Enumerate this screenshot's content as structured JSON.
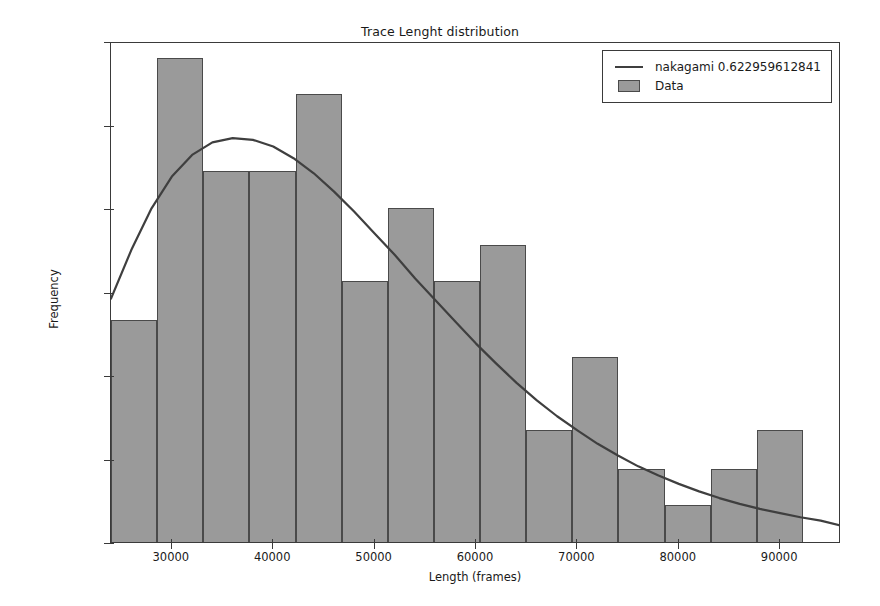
{
  "chart_data": {
    "type": "bar",
    "title": "Trace Lenght distribution",
    "xlabel": "Length (frames)",
    "ylabel": "Frequency",
    "xlim": [
      24000,
      96000
    ],
    "ylim": [
      0.0,
      3e-05
    ],
    "xticks": [
      30000,
      40000,
      50000,
      60000,
      70000,
      80000,
      90000
    ],
    "xtick_labels": [
      "30000",
      "40000",
      "50000",
      "60000",
      "70000",
      "80000",
      "90000"
    ],
    "yticks": [
      0.0,
      5e-06,
      1e-05,
      1.5e-05,
      2e-05,
      2.5e-05,
      3e-05
    ],
    "ytick_labels": [
      "0.000000",
      "0.000005",
      "0.000010",
      "0.000015",
      "0.000020",
      "0.000025",
      "0.000030"
    ],
    "grid": false,
    "legend_position": "upper right",
    "series": [
      {
        "name": "Data",
        "type": "histogram",
        "color": "#9a9a9a",
        "edge_color": "#4a4a4a",
        "bin_edges": [
          24000,
          28550,
          33100,
          37650,
          42200,
          46750,
          51300,
          55850,
          60400,
          64950,
          69500,
          74050,
          78600,
          83150,
          87700,
          92250
        ],
        "values": [
          1.33e-05,
          2.9e-05,
          2.22e-05,
          2.22e-05,
          2.68e-05,
          1.56e-05,
          2e-05,
          1.56e-05,
          1.78e-05,
          6.7e-06,
          1.11e-05,
          4.4e-06,
          2.2e-06,
          4.4e-06,
          6.7e-06
        ]
      },
      {
        "name": "nakagami 0.622959612841",
        "type": "line",
        "color": "#3f3f3f",
        "x": [
          24000,
          26000,
          28000,
          30000,
          32000,
          34000,
          36000,
          38000,
          40000,
          42000,
          44000,
          46000,
          48000,
          50000,
          52000,
          54000,
          56000,
          58000,
          60000,
          62000,
          64000,
          66000,
          68000,
          70000,
          72000,
          74000,
          76000,
          78000,
          80000,
          82000,
          84000,
          86000,
          88000,
          90000,
          92000,
          94000,
          96000
        ],
        "y": [
          1.47e-05,
          1.76e-05,
          2.01e-05,
          2.2e-05,
          2.33e-05,
          2.405e-05,
          2.43e-05,
          2.42e-05,
          2.38e-05,
          2.31e-05,
          2.22e-05,
          2.11e-05,
          1.99e-05,
          1.86e-05,
          1.73e-05,
          1.59e-05,
          1.46e-05,
          1.33e-05,
          1.2e-05,
          1.08e-05,
          9.65e-06,
          8.6e-06,
          7.65e-06,
          6.8e-06,
          6e-06,
          5.3e-06,
          4.65e-06,
          4.1e-06,
          3.6e-06,
          3.15e-06,
          2.75e-06,
          2.4e-06,
          2.1e-06,
          1.85e-06,
          1.6e-06,
          1.4e-06,
          1.1e-06
        ]
      }
    ]
  },
  "legend": {
    "entries": [
      {
        "label": "nakagami 0.622959612841",
        "key": "line",
        "color": "#3f3f3f"
      },
      {
        "label": "Data",
        "key": "patch",
        "color": "#9a9a9a"
      }
    ]
  }
}
